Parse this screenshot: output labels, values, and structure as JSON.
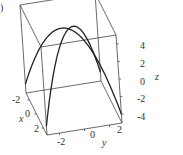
{
  "panel_label": ")",
  "chart_data": {
    "type": "line",
    "title": "",
    "projection": "3d-box",
    "xlabel": "x",
    "ylabel": "y",
    "zlabel": "z",
    "x_ticks": [
      "-2",
      "0",
      "2"
    ],
    "y_ticks": [
      "-2",
      "0",
      "2"
    ],
    "z_ticks": [
      "4",
      "2",
      "0",
      "-2",
      "-4"
    ],
    "xlim": [
      -3,
      3
    ],
    "ylim": [
      -3,
      3
    ],
    "zlim": [
      -5,
      5
    ],
    "series": [
      {
        "name": "curve-1",
        "description": "parabolic arch from (x=-3,y=-3,z=-4) through peak to (x=3,y=3,z=-4)",
        "points": [
          [
            -3,
            -3,
            -4
          ],
          [
            -1.5,
            -1.5,
            1.75
          ],
          [
            0,
            0,
            4
          ],
          [
            1.5,
            1.5,
            1.75
          ],
          [
            3,
            3,
            -4
          ]
        ]
      },
      {
        "name": "curve-2",
        "description": "parabolic arch from (x=3,y=-3,z=-4) through peak to (x=-3,y=3,z=-4)",
        "points": [
          [
            3,
            -3,
            -4
          ],
          [
            1.5,
            -1.5,
            1.75
          ],
          [
            0,
            0,
            4
          ],
          [
            -1.5,
            1.5,
            1.75
          ],
          [
            -3,
            3,
            -4
          ]
        ]
      }
    ]
  }
}
